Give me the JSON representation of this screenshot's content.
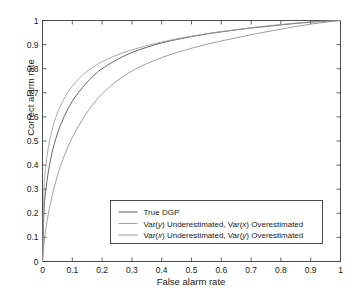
{
  "chart_data": {
    "type": "line",
    "title": "",
    "xlabel": "False alarm rate",
    "ylabel": "Correct alarm rate",
    "xlim": [
      0,
      1
    ],
    "ylim": [
      0,
      1
    ],
    "grid": false,
    "legend_position": "bottom-right",
    "x_ticks": [
      "0",
      "0.1",
      "0.2",
      "0.3",
      "0.4",
      "0.5",
      "0.6",
      "0.7",
      "0.8",
      "0.9",
      "1"
    ],
    "y_ticks": [
      "0",
      "0.1",
      "0.2",
      "0.3",
      "0.4",
      "0.5",
      "0.6",
      "0.7",
      "0.8",
      "0.9",
      "1"
    ],
    "x_tick_values": [
      0,
      0.1,
      0.2,
      0.3,
      0.4,
      0.5,
      0.6,
      0.7,
      0.8,
      0.9,
      1
    ],
    "y_tick_values": [
      0,
      0.1,
      0.2,
      0.3,
      0.4,
      0.5,
      0.6,
      0.7,
      0.8,
      0.9,
      1
    ],
    "x": [
      0,
      0.005,
      0.01,
      0.02,
      0.03,
      0.04,
      0.05,
      0.06,
      0.08,
      0.1,
      0.12,
      0.15,
      0.18,
      0.2,
      0.25,
      0.3,
      0.35,
      0.4,
      0.45,
      0.5,
      0.55,
      0.6,
      0.65,
      0.7,
      0.75,
      0.8,
      0.85,
      0.9,
      0.95,
      1
    ],
    "series": [
      {
        "name": "True DGP",
        "color": "#4a4a4a",
        "values": [
          0,
          0.205,
          0.285,
          0.375,
          0.44,
          0.49,
          0.53,
          0.565,
          0.62,
          0.665,
          0.7,
          0.745,
          0.78,
          0.8,
          0.838,
          0.867,
          0.889,
          0.907,
          0.921,
          0.933,
          0.944,
          0.953,
          0.961,
          0.969,
          0.975,
          0.982,
          0.988,
          0.993,
          0.997,
          1
        ]
      },
      {
        "name": "Var(y) Underestimated, Var(x) Overestimated",
        "color": "#9a9a9a",
        "values": [
          0,
          0.295,
          0.385,
          0.475,
          0.535,
          0.58,
          0.615,
          0.645,
          0.692,
          0.728,
          0.756,
          0.79,
          0.815,
          0.829,
          0.857,
          0.878,
          0.896,
          0.911,
          0.924,
          0.935,
          0.945,
          0.954,
          0.962,
          0.97,
          0.977,
          0.983,
          0.989,
          0.994,
          0.998,
          1
        ]
      },
      {
        "name": "Var(x) Underestimated, Var(y) Overestimated",
        "color": "#8c8c8c",
        "values": [
          0,
          0.075,
          0.125,
          0.2,
          0.26,
          0.31,
          0.355,
          0.395,
          0.46,
          0.515,
          0.56,
          0.62,
          0.668,
          0.695,
          0.75,
          0.79,
          0.821,
          0.846,
          0.867,
          0.885,
          0.901,
          0.915,
          0.928,
          0.941,
          0.953,
          0.964,
          0.975,
          0.985,
          0.993,
          1
        ]
      }
    ],
    "annotations": {
      "crossing_point": {
        "x": 0.18,
        "y": 0.81
      }
    }
  },
  "legend": {
    "entries": [
      {
        "label": "True DGP",
        "label_parts": [
          {
            "text": "True DGP",
            "italic": false
          }
        ]
      },
      {
        "label": "Var(y) Underestimated, Var(x) Overestimated",
        "label_parts": [
          {
            "text": "Var(",
            "italic": false
          },
          {
            "text": "y",
            "italic": true
          },
          {
            "text": ") Underestimated, Var(",
            "italic": false
          },
          {
            "text": "x",
            "italic": true
          },
          {
            "text": ") Overestimated",
            "italic": false
          }
        ]
      },
      {
        "label": "Var(x) Underestimated, Var(y) Overestimated",
        "label_parts": [
          {
            "text": "Var(",
            "italic": false
          },
          {
            "text": "x",
            "italic": true
          },
          {
            "text": ") Underestimated, Var(",
            "italic": false
          },
          {
            "text": "y",
            "italic": true
          },
          {
            "text": ") Overestimated",
            "italic": false
          }
        ]
      }
    ]
  },
  "colors": {
    "axis": "#3a3a3a",
    "text": "#1a1a1a",
    "legend_border": "#3a3a3a",
    "background": "#ffffff"
  }
}
